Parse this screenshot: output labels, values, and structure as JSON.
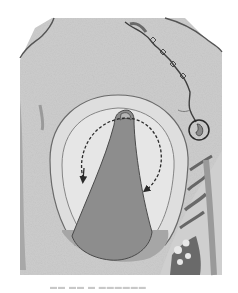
{
  "figure": {
    "colors": {
      "background": "#ffffff",
      "tissue": "#c9c9c9",
      "tissue_light": "#dcdcdc",
      "capsule_fill": "#e4e4e4",
      "mass": "#8c8c8c",
      "outline": "#4a4a4a",
      "dark": "#3a3a3a"
    },
    "annotations": {
      "rotation_arrow": "dashed curved double-headed arrow",
      "circle_marker": "circled detail at end of vessel"
    }
  },
  "caption": {
    "text": "▬▬  ▬▬ ▬ ▬▬▬▬▬▬"
  }
}
